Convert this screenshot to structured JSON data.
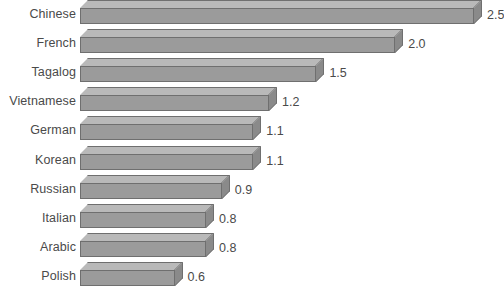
{
  "chart_data": {
    "type": "bar",
    "orientation": "horizontal",
    "title": "",
    "subtitle": "",
    "xlabel": "",
    "ylabel": "",
    "grid": false,
    "legend": false,
    "xlim": [
      0,
      2.5
    ],
    "categories": [
      "Chinese",
      "French",
      "Tagalog",
      "Vietnamese",
      "German",
      "Korean",
      "Russian",
      "Italian",
      "Arabic",
      "Polish"
    ],
    "values": [
      2.5,
      2.0,
      1.5,
      1.2,
      1.1,
      1.1,
      0.9,
      0.8,
      0.8,
      0.6
    ],
    "value_labels": [
      "2.5",
      "2.0",
      "1.5",
      "1.2",
      "1.1",
      "1.1",
      "0.9",
      "0.8",
      "0.8",
      "0.6"
    ],
    "bars": [
      {
        "category": "Chinese",
        "value": 2.5,
        "label": "2.5"
      },
      {
        "category": "French",
        "value": 2.0,
        "label": "2.0"
      },
      {
        "category": "Tagalog",
        "value": 1.5,
        "label": "1.5"
      },
      {
        "category": "Vietnamese",
        "value": 1.2,
        "label": "1.2"
      },
      {
        "category": "German",
        "value": 1.1,
        "label": "1.1"
      },
      {
        "category": "Korean",
        "value": 1.1,
        "label": "1.1"
      },
      {
        "category": "Russian",
        "value": 0.9,
        "label": "0.9"
      },
      {
        "category": "Italian",
        "value": 0.8,
        "label": "0.8"
      },
      {
        "category": "Arabic",
        "value": 0.8,
        "label": "0.8"
      },
      {
        "category": "Polish",
        "value": 0.6,
        "label": "0.6"
      }
    ]
  },
  "style": {
    "background": "#ffffff",
    "bar_front": "#9b9b9b",
    "bar_top": "#b9b9b9",
    "bar_side": "#8a8a8a",
    "bar_outline": "#6f6f6f",
    "text": "#4a4a4a"
  }
}
